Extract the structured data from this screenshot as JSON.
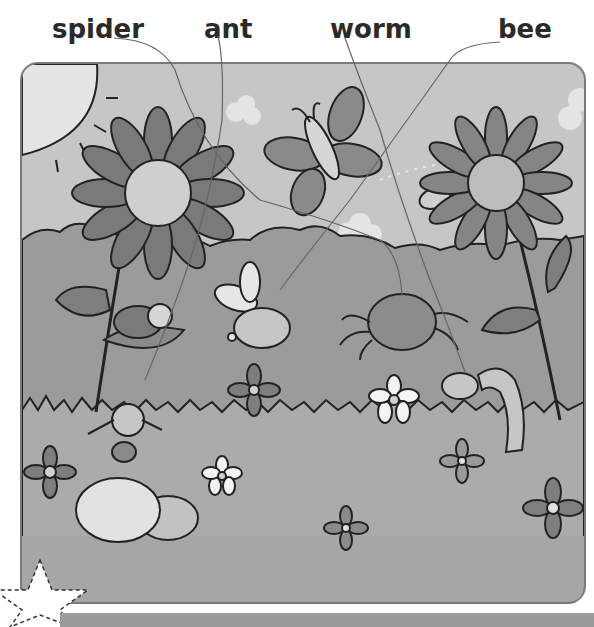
{
  "worksheet": {
    "type": "match-words-to-picture",
    "labels": [
      {
        "id": "spider",
        "text": "spider",
        "x": 52
      },
      {
        "id": "ant",
        "text": "ant",
        "x": 204
      },
      {
        "id": "worm",
        "text": "worm",
        "x": 330
      },
      {
        "id": "bee",
        "text": "bee",
        "x": 498
      }
    ],
    "scene": {
      "background_color": "#bdbdbd",
      "sky_color": "#c7c7c7",
      "hedge_color": "#9a9a9a",
      "grass_color": "#aaaaaa",
      "frame_color": "#7a7a7a",
      "sun_color": "#e6e6e6",
      "petal_color": "#7c7c7c",
      "center_color": "#cfcfcf",
      "creatures": [
        "butterfly",
        "ladybird",
        "bee",
        "spider",
        "worm",
        "ant",
        "hidden-bee"
      ],
      "flowers": [
        "sunflower-left",
        "sunflower-right",
        "daisy-white",
        "flower-small-1",
        "flower-small-2",
        "flower-small-3",
        "flower-small-4",
        "flower-small-5"
      ],
      "decorations": [
        "sun",
        "clouds",
        "stones",
        "star"
      ]
    }
  }
}
